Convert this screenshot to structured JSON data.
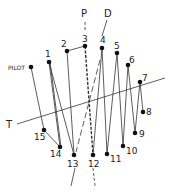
{
  "diagram": {
    "labels": {
      "pilot": "PILOT",
      "p": "P",
      "d": "D",
      "t": "T"
    },
    "points": [
      {
        "id": "pilot",
        "label": "PILOT",
        "x": 31,
        "y": 67
      },
      {
        "id": "1",
        "label": "1",
        "x": 49,
        "y": 62
      },
      {
        "id": "2",
        "label": "2",
        "x": 67,
        "y": 51
      },
      {
        "id": "3",
        "label": "3",
        "x": 85,
        "y": 46
      },
      {
        "id": "4",
        "label": "4",
        "x": 102,
        "y": 48
      },
      {
        "id": "5",
        "label": "5",
        "x": 117,
        "y": 53
      },
      {
        "id": "6",
        "label": "6",
        "x": 128,
        "y": 65
      },
      {
        "id": "7",
        "label": "7",
        "x": 140,
        "y": 82
      },
      {
        "id": "8",
        "label": "8",
        "x": 143,
        "y": 112
      },
      {
        "id": "9",
        "label": "9",
        "x": 135,
        "y": 133
      },
      {
        "id": "10",
        "label": "10",
        "x": 123,
        "y": 146
      },
      {
        "id": "11",
        "label": "11",
        "x": 107,
        "y": 154
      },
      {
        "id": "12",
        "label": "12",
        "x": 93,
        "y": 155
      },
      {
        "id": "13",
        "label": "13",
        "x": 74,
        "y": 155
      },
      {
        "id": "14",
        "label": "14",
        "x": 60,
        "y": 147
      },
      {
        "id": "15",
        "label": "15",
        "x": 44,
        "y": 130
      }
    ],
    "stroke_color": "#333333",
    "dot_color": "#111111"
  }
}
